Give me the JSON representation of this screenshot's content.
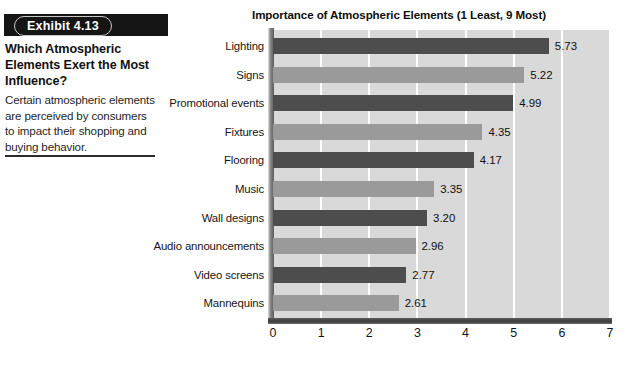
{
  "exhibit": {
    "number_label": "Exhibit 4.13",
    "headline": "Which Atmospheric Elements Exert the Most Influence?",
    "body": "Certain atmospheric elements are perceived by consumers to impact their shopping and buying behavior."
  },
  "chart_data": {
    "type": "bar",
    "orientation": "horizontal",
    "title": "Importance of Atmospheric Elements (1 Least, 9 Most)",
    "xlabel": "",
    "ylabel": "",
    "xlim": [
      0,
      7
    ],
    "xticks": [
      "0",
      "1",
      "2",
      "3",
      "4",
      "5",
      "6",
      "7"
    ],
    "grid": true,
    "grid_axis": "x",
    "legend": false,
    "categories": [
      "Lighting",
      "Signs",
      "Promotional events",
      "Fixtures",
      "Flooring",
      "Music",
      "Wall designs",
      "Audio announcements",
      "Video screens",
      "Mannequins"
    ],
    "values": [
      5.73,
      5.22,
      4.99,
      4.35,
      4.17,
      3.35,
      3.2,
      2.96,
      2.77,
      2.61
    ],
    "value_labels": [
      "5.73",
      "5.22",
      "4.99",
      "4.35",
      "4.17",
      "3.35",
      "3.20",
      "2.96",
      "2.77",
      "2.61"
    ],
    "bar_colors": [
      "#4d4d4d",
      "#9a9a9a",
      "#4d4d4d",
      "#9a9a9a",
      "#4d4d4d",
      "#9a9a9a",
      "#4d4d4d",
      "#9a9a9a",
      "#4d4d4d",
      "#9a9a9a"
    ],
    "plot_background": "#d9d9d9",
    "gridline_color": "#ffffff"
  }
}
